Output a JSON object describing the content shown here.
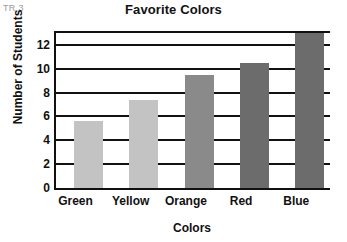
{
  "corner_code": "TR 3",
  "chart_data": {
    "type": "bar",
    "title": "Favorite Colors",
    "xlabel": "Colors",
    "ylabel": "Number of Students",
    "categories": [
      "Green",
      "Yellow",
      "Orange",
      "Red",
      "Blue"
    ],
    "values": [
      5.6,
      7.4,
      9.5,
      10.5,
      13
    ],
    "ylim": [
      0,
      13
    ],
    "yticks": [
      0,
      2,
      4,
      6,
      8,
      10,
      12
    ],
    "ytick_labels": [
      "0",
      "2",
      "4",
      "6",
      "8",
      "10",
      "12"
    ],
    "grid": true,
    "legend": false,
    "bar_colors": [
      "#c3c3c3",
      "#c3c3c3",
      "#8a8a8a",
      "#6c6c6c",
      "#6c6c6c"
    ],
    "axis_color": "#111111",
    "background": "#ffffff"
  }
}
